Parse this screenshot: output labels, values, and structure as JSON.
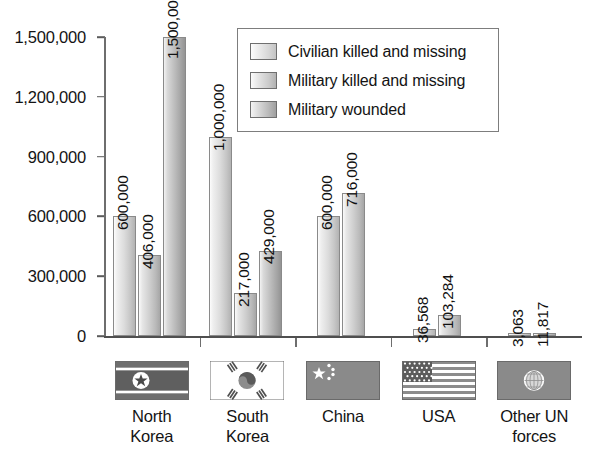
{
  "chart_data": {
    "type": "bar",
    "title": "",
    "xlabel": "",
    "ylabel": "",
    "ylim": [
      0,
      1500000
    ],
    "grid": false,
    "legend_position": "top-center",
    "y_ticks": [
      "0",
      "300,000",
      "600,000",
      "900,000",
      "1,200,000",
      "1,500,000"
    ],
    "y_tick_values": [
      0,
      300000,
      600000,
      900000,
      1200000,
      1500000
    ],
    "categories": [
      "North Korea",
      "South Korea",
      "China",
      "USA",
      "Other UN forces"
    ],
    "series": [
      {
        "name": "Civilian killed and missing",
        "values": [
          600000,
          1000000,
          600000,
          36568,
          3063
        ],
        "labels": [
          "600,000",
          "1,000,000",
          "600,000",
          "36,568",
          "3,063"
        ]
      },
      {
        "name": "Military killed and missing",
        "values": [
          406000,
          217000,
          716000,
          103284,
          11817
        ],
        "labels": [
          "406,000",
          "217,000",
          "716,000",
          "103,284",
          "11,817"
        ]
      },
      {
        "name": "Military wounded",
        "values": [
          1500000,
          429000,
          null,
          null,
          null
        ],
        "labels": [
          "1,500,000",
          "429,000",
          "",
          "",
          ""
        ]
      }
    ]
  },
  "legend": {
    "items": [
      {
        "label": "Civilian killed and missing",
        "swatch": "legend-swatch-1"
      },
      {
        "label": "Military killed and missing",
        "swatch": "legend-swatch-2"
      },
      {
        "label": "Military wounded",
        "swatch": "legend-swatch-3"
      }
    ]
  },
  "categories": [
    {
      "line1": "North",
      "line2": "Korea",
      "flag": "north-korea-flag"
    },
    {
      "line1": "South",
      "line2": "Korea",
      "flag": "south-korea-flag"
    },
    {
      "line1": "China",
      "line2": "",
      "flag": "china-flag"
    },
    {
      "line1": "USA",
      "line2": "",
      "flag": "usa-flag"
    },
    {
      "line1": "Other UN",
      "line2": "forces",
      "flag": "united-nations-flag"
    }
  ],
  "colors": {
    "background": "#ffffff",
    "axis": "#4f4f4f",
    "text": "#141414",
    "bar_light": "#e2e2e2",
    "bar_mid": "#cccccc",
    "bar_dark": "#b0b0b0",
    "flag_dark": "#6b6b6b",
    "flag_mid": "#9a9a9a"
  }
}
